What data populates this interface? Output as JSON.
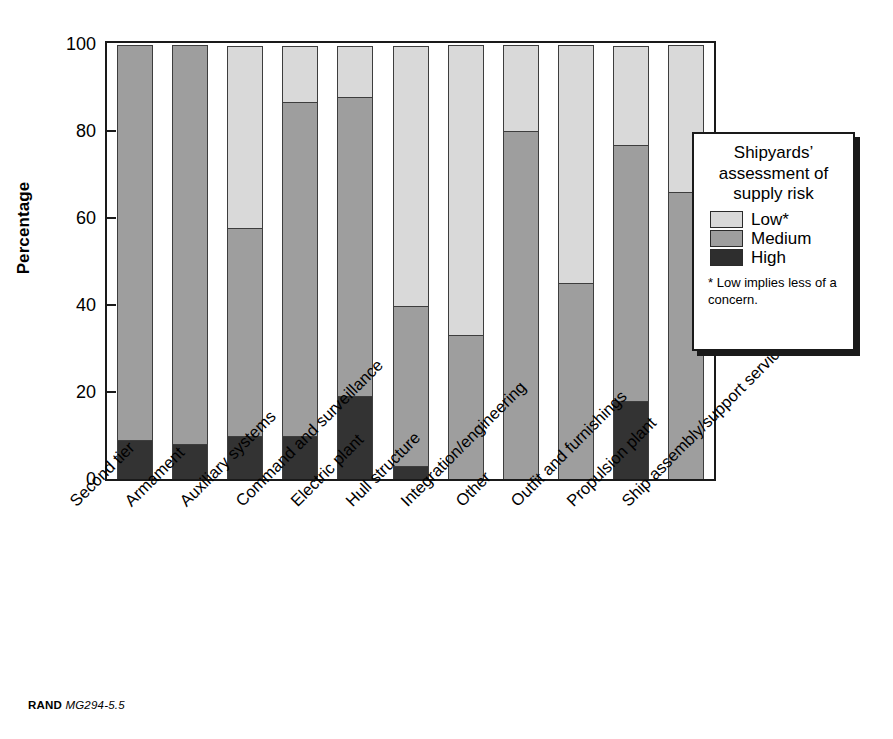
{
  "figure": {
    "source_prefix": "RAND",
    "source_code": "MG294-5.5"
  },
  "legend": {
    "title": "Shipyards’ assessment of supply risk",
    "items": [
      {
        "label": "Low*",
        "color": "#d9d9d9"
      },
      {
        "label": "Medium",
        "color": "#9e9e9e"
      },
      {
        "label": "High",
        "color": "#2e2e2e"
      }
    ],
    "note": "* Low implies less of a concern."
  },
  "chart_data": {
    "type": "bar",
    "subtype": "stacked-100-percent",
    "title": "",
    "xlabel": "",
    "ylabel": "Percentage",
    "ylim": [
      0,
      100
    ],
    "yticks": [
      0,
      20,
      40,
      60,
      80,
      100
    ],
    "ytick_labels": [
      "0",
      "20",
      "40",
      "60",
      "80",
      "100"
    ],
    "grid": false,
    "legend_position": "right",
    "categories": [
      "Second tier",
      "Armament",
      "Auxiliary systems",
      "Command and surveillance",
      "Electric plant",
      "Hull structure",
      "Integration/engineering",
      "Other",
      "Outfit and furnishings",
      "Propulsion plant",
      "Ship assembly/support services"
    ],
    "series": [
      {
        "name": "High",
        "color": "#333333",
        "values": [
          9,
          8,
          10,
          10,
          19,
          3,
          0,
          0,
          0,
          18,
          0
        ]
      },
      {
        "name": "Medium",
        "color": "#9e9e9e",
        "values": [
          91,
          92,
          48,
          77,
          69,
          37,
          33,
          80,
          45,
          59,
          66
        ]
      },
      {
        "name": "Low*",
        "color": "#d9d9d9",
        "values": [
          0,
          0,
          42,
          13,
          12,
          60,
          67,
          20,
          55,
          23,
          34
        ]
      }
    ],
    "stack_tops": {
      "high": [
        9,
        8,
        10,
        10,
        19,
        3,
        0,
        0,
        0,
        18,
        0
      ],
      "high_plus_medium": [
        100,
        100,
        58,
        87,
        88,
        40,
        33,
        80,
        45,
        77,
        66
      ]
    }
  }
}
